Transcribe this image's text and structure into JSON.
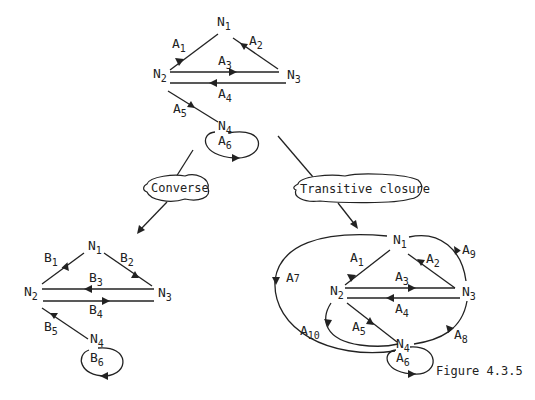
{
  "figure": {
    "caption": "Figure 4.3.5",
    "operations": {
      "converse": "Converse",
      "transitive_closure": "Transitive closure"
    },
    "original_graph": {
      "nodes": {
        "n1": "N",
        "n1s": "1",
        "n2": "N",
        "n2s": "2",
        "n3": "N",
        "n3s": "3",
        "n4": "N",
        "n4s": "4"
      },
      "edges": [
        {
          "label": "A",
          "sub": "1",
          "from": "N1",
          "to": "N2"
        },
        {
          "label": "A",
          "sub": "2",
          "from": "N3",
          "to": "N1"
        },
        {
          "label": "A",
          "sub": "3",
          "from": "N2",
          "to": "N3"
        },
        {
          "label": "A",
          "sub": "4",
          "from": "N3",
          "to": "N2"
        },
        {
          "label": "A",
          "sub": "5",
          "from": "N2",
          "to": "N4"
        },
        {
          "label": "A",
          "sub": "6",
          "from": "N4",
          "to": "N4"
        }
      ]
    },
    "converse_graph": {
      "nodes": {
        "n1": "N",
        "n1s": "1",
        "n2": "N",
        "n2s": "2",
        "n3": "N",
        "n3s": "3",
        "n4": "N",
        "n4s": "4"
      },
      "edges": [
        {
          "label": "B",
          "sub": "1",
          "from": "N2",
          "to": "N1"
        },
        {
          "label": "B",
          "sub": "2",
          "from": "N1",
          "to": "N3"
        },
        {
          "label": "B",
          "sub": "3",
          "from": "N3",
          "to": "N2"
        },
        {
          "label": "B",
          "sub": "4",
          "from": "N2",
          "to": "N3"
        },
        {
          "label": "B",
          "sub": "5",
          "from": "N4",
          "to": "N2"
        },
        {
          "label": "B",
          "sub": "6",
          "from": "N4",
          "to": "N4"
        }
      ]
    },
    "closure_graph": {
      "nodes": {
        "n1": "N",
        "n1s": "1",
        "n2": "N",
        "n2s": "2",
        "n3": "N",
        "n3s": "3",
        "n4": "N",
        "n4s": "4"
      },
      "edges": [
        {
          "label": "A",
          "sub": "1",
          "from": "N1",
          "to": "N2"
        },
        {
          "label": "A",
          "sub": "2",
          "from": "N3",
          "to": "N1"
        },
        {
          "label": "A",
          "sub": "3",
          "from": "N2",
          "to": "N3"
        },
        {
          "label": "A",
          "sub": "4",
          "from": "N3",
          "to": "N2"
        },
        {
          "label": "A",
          "sub": "5",
          "from": "N2",
          "to": "N4"
        },
        {
          "label": "A",
          "sub": "6",
          "from": "N4",
          "to": "N4"
        },
        {
          "label": "A",
          "sub": "7",
          "from": "N1",
          "to": "N4"
        },
        {
          "label": "A",
          "sub": "8",
          "from": "N3",
          "to": "N4"
        },
        {
          "label": "A",
          "sub": "9",
          "from": "N1",
          "to": "N3"
        },
        {
          "label": "A",
          "sub": "10",
          "from": "N2",
          "to": "N2"
        }
      ]
    }
  }
}
